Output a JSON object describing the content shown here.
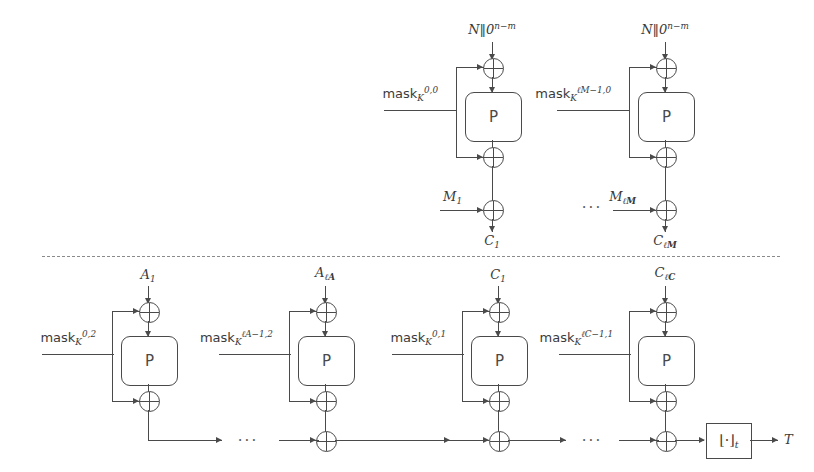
{
  "figure": {
    "separator": "dashed-divider",
    "encryption_section": {
      "blocks": [
        {
          "nonce_label": "N‖0",
          "nonce_sup": "n−m",
          "mask_base": "mask",
          "mask_sub": "K",
          "mask_sup": "0,0",
          "perm_label": "P",
          "message_label": "M",
          "message_sub": "1",
          "cipher_label": "C",
          "cipher_sub": "1"
        },
        {
          "nonce_label": "N‖0",
          "nonce_sup": "n−m",
          "mask_base": "mask",
          "mask_sub": "K",
          "mask_sup": "ℓM−1,0",
          "perm_label": "P",
          "message_label": "M",
          "message_sub": "ℓM",
          "cipher_label": "C",
          "cipher_sub": "ℓM"
        }
      ],
      "ellipsis": "···"
    },
    "authentication_section": {
      "blocks": [
        {
          "input_label": "A",
          "input_sub": "1",
          "mask_base": "mask",
          "mask_sub": "K",
          "mask_sup": "0,2",
          "perm_label": "P"
        },
        {
          "input_label": "A",
          "input_sub": "ℓA",
          "mask_base": "mask",
          "mask_sub": "K",
          "mask_sup": "ℓA−1,2",
          "perm_label": "P"
        },
        {
          "input_label": "C",
          "input_sub": "1",
          "mask_base": "mask",
          "mask_sub": "K",
          "mask_sup": "0,1",
          "perm_label": "P"
        },
        {
          "input_label": "C",
          "input_sub": "ℓC",
          "mask_base": "mask",
          "mask_sub": "K",
          "mask_sup": "ℓC−1,1",
          "perm_label": "P"
        }
      ],
      "ellipsis_1": "···",
      "ellipsis_2": "···",
      "truncation_label": "⌊·⌋",
      "truncation_sub": "t",
      "tag_label": "T"
    }
  },
  "colors": {
    "line": "#4a4a4a",
    "text": "#3a3a3a",
    "divider": "#8a8a8a",
    "background": "#ffffff"
  }
}
